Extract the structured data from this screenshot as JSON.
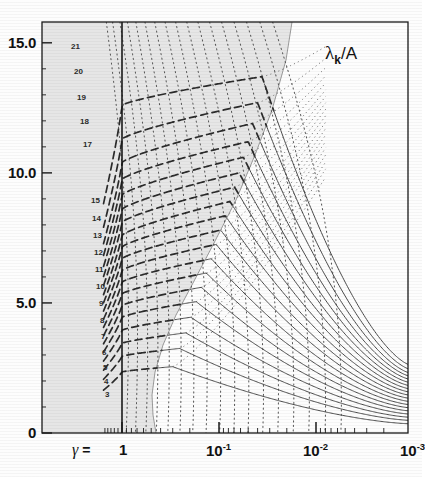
{
  "figure": {
    "corner_label": {
      "lambda": "λ",
      "subscript": "k",
      "slash_den": "/A"
    },
    "axis_eq_prefix": "γ",
    "axis_eq_sign": "="
  },
  "chart_data": {
    "type": "line",
    "title": "",
    "xlabel": "γ",
    "ylabel": "λk/A",
    "xscale": "log",
    "xlim": [
      1,
      0.001
    ],
    "ylim": [
      0,
      15.8
    ],
    "grid": false,
    "legend": null,
    "x_ticks": [
      {
        "label": "1",
        "value": 1
      },
      {
        "label": "10",
        "exp": "-1",
        "value": 0.1
      },
      {
        "label": "10",
        "exp": "-2",
        "value": 0.01
      },
      {
        "label": "10",
        "exp": "-3",
        "value": 0.001
      }
    ],
    "y_ticks": [
      {
        "label": "0",
        "value": 0
      },
      {
        "label": "5.0",
        "value": 5
      },
      {
        "label": "10.0",
        "value": 10
      },
      {
        "label": "15.0",
        "value": 15
      }
    ],
    "curve_labels": [
      "3",
      "4",
      "5",
      "6",
      "7",
      "8",
      "9",
      "10",
      "11",
      "12",
      "13",
      "14",
      "15",
      "17",
      "18",
      "19",
      "20",
      "21"
    ],
    "series_note": "mode-index family k=3..21; dashed inside shaded region, solid outside",
    "shaded_region": {
      "fill": "#e6e6e6",
      "description": "grey wedge left of diagonal boundary"
    },
    "colors": {
      "ink": "#1a1a1a",
      "shade": "#e6e6e6",
      "paper": "#fdfdfd"
    },
    "curves": [
      {
        "label": "3",
        "y_at_gamma1": 2.35,
        "peak_y": 2.55,
        "peak_x": 0.3,
        "y_at_min": 0.35
      },
      {
        "label": "4",
        "y_at_gamma1": 2.95,
        "peak_y": 3.25,
        "peak_x": 0.255,
        "y_at_min": 0.48
      },
      {
        "label": "5",
        "y_at_gamma1": 3.45,
        "peak_y": 3.85,
        "peak_x": 0.22,
        "y_at_min": 0.6
      },
      {
        "label": "6",
        "y_at_gamma1": 3.95,
        "peak_y": 4.45,
        "peak_x": 0.195,
        "y_at_min": 0.72
      },
      {
        "label": "7",
        "y_at_gamma1": 4.45,
        "peak_y": 5.05,
        "peak_x": 0.172,
        "y_at_min": 0.84
      },
      {
        "label": "8",
        "y_at_gamma1": 4.9,
        "peak_y": 5.6,
        "peak_x": 0.152,
        "y_at_min": 0.96
      },
      {
        "label": "9",
        "y_at_gamma1": 5.35,
        "peak_y": 6.15,
        "peak_x": 0.135,
        "y_at_min": 1.08
      },
      {
        "label": "10",
        "y_at_gamma1": 5.8,
        "peak_y": 6.7,
        "peak_x": 0.12,
        "y_at_min": 1.2
      },
      {
        "label": "11",
        "y_at_gamma1": 6.25,
        "peak_y": 7.25,
        "peak_x": 0.107,
        "y_at_min": 1.32
      },
      {
        "label": "12",
        "y_at_gamma1": 6.7,
        "peak_y": 7.8,
        "peak_x": 0.096,
        "y_at_min": 1.44
      },
      {
        "label": "13",
        "y_at_gamma1": 7.15,
        "peak_y": 8.35,
        "peak_x": 0.086,
        "y_at_min": 1.56
      },
      {
        "label": "14",
        "y_at_gamma1": 7.6,
        "peak_y": 8.9,
        "peak_x": 0.077,
        "y_at_min": 1.68
      },
      {
        "label": "15",
        "y_at_gamma1": 8.1,
        "peak_y": 9.45,
        "peak_x": 0.069,
        "y_at_min": 1.8
      },
      {
        "label": "16",
        "y_at_gamma1": 8.6,
        "peak_y": 10.0,
        "peak_x": 0.062,
        "y_at_min": 1.92
      },
      {
        "label": "17",
        "y_at_gamma1": 9.15,
        "peak_y": 10.6,
        "peak_x": 0.056,
        "y_at_min": 2.04
      },
      {
        "label": "18",
        "y_at_gamma1": 9.75,
        "peak_y": 11.2,
        "peak_x": 0.05,
        "y_at_min": 2.16
      },
      {
        "label": "19",
        "y_at_gamma1": 10.4,
        "peak_y": 11.9,
        "peak_x": 0.045,
        "y_at_min": 2.28
      },
      {
        "label": "20",
        "y_at_gamma1": 11.3,
        "peak_y": 12.7,
        "peak_x": 0.04,
        "y_at_min": 2.42
      },
      {
        "label": "21",
        "y_at_gamma1": 12.6,
        "peak_y": 13.7,
        "peak_x": 0.036,
        "y_at_min": 2.58
      }
    ]
  }
}
